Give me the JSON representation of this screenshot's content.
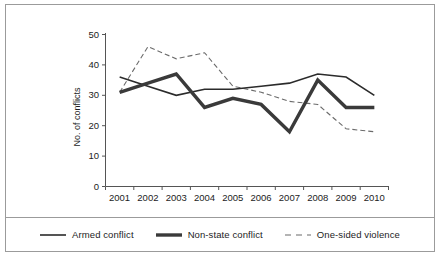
{
  "chart_data": {
    "type": "line",
    "title": "",
    "xlabel": "",
    "ylabel": "No. of conflicts",
    "categories": [
      "2001",
      "2002",
      "2003",
      "2004",
      "2005",
      "2006",
      "2007",
      "2008",
      "2009",
      "2010"
    ],
    "x": [
      2001,
      2002,
      2003,
      2004,
      2005,
      2006,
      2007,
      2008,
      2009,
      2010
    ],
    "ylim": [
      0,
      50
    ],
    "yticks": [
      0,
      10,
      20,
      30,
      40,
      50
    ],
    "ytick_labels": [
      "0",
      "10",
      "20",
      "30",
      "40",
      "50"
    ],
    "grid": false,
    "legend_position": "bottom",
    "series": [
      {
        "name": "Armed conflict",
        "style": "solid-thin",
        "color": "#2b2b2b",
        "values": [
          36,
          33,
          30,
          32,
          32,
          33,
          34,
          37,
          36,
          30
        ]
      },
      {
        "name": "Non-state conflict",
        "style": "solid-thick",
        "color": "#3a3a3a",
        "values": [
          31,
          34,
          37,
          26,
          29,
          27,
          18,
          35,
          26,
          26
        ]
      },
      {
        "name": "One-sided violence",
        "style": "dashed",
        "color": "#6b6b6b",
        "values": [
          31,
          46,
          42,
          44,
          33,
          31,
          28,
          27,
          19,
          18
        ]
      }
    ]
  },
  "axis": {
    "ylabel": "No. of conflicts",
    "ytick_0": "0",
    "ytick_10": "10",
    "ytick_20": "20",
    "ytick_30": "30",
    "ytick_40": "40",
    "ytick_50": "50",
    "xtick_2001": "2001",
    "xtick_2002": "2002",
    "xtick_2003": "2003",
    "xtick_2004": "2004",
    "xtick_2005": "2005",
    "xtick_2006": "2006",
    "xtick_2007": "2007",
    "xtick_2008": "2008",
    "xtick_2009": "2009",
    "xtick_2010": "2010"
  },
  "legend": {
    "items": [
      {
        "label": "Armed conflict"
      },
      {
        "label": "Non-state conflict"
      },
      {
        "label": "One-sided violence"
      }
    ]
  }
}
